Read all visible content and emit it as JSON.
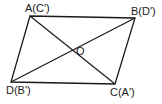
{
  "figure": {
    "type": "parallelogram with diagonals",
    "vertices": {
      "A": {
        "label": "A(C')",
        "x": 30,
        "y": 16
      },
      "B": {
        "label": "B(D')",
        "x": 135,
        "y": 18
      },
      "C": {
        "label": "C(A')",
        "x": 115,
        "y": 84
      },
      "D": {
        "label": "D(B')",
        "x": 11,
        "y": 82
      }
    },
    "center": {
      "label": "O",
      "x": 73,
      "y": 51
    },
    "stroke_color": "#1a1a1a"
  }
}
